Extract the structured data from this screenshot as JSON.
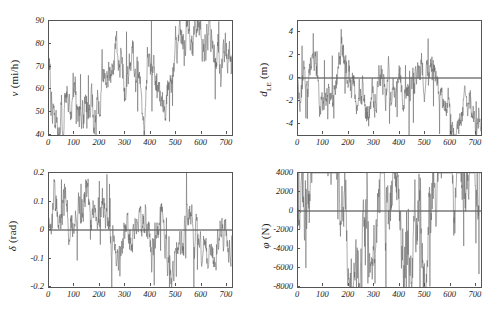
{
  "figure": {
    "background": "#ffffff",
    "line_color": "#666666",
    "axis_color": "#555555",
    "zero_line_color": "#222222"
  },
  "chart_data": [
    {
      "id": "panel-velocity",
      "type": "line",
      "title": "",
      "xlabel": "",
      "ylabel": "v (mi/h)",
      "ylabel_symbol": "v",
      "ylabel_unit": "(mi/h)",
      "ylabel_sub": "",
      "xlim": [
        0,
        720
      ],
      "ylim": [
        40,
        90
      ],
      "xticks": [
        0,
        100,
        200,
        300,
        400,
        500,
        600,
        700
      ],
      "yticks": [
        40,
        50,
        60,
        70,
        80,
        90
      ],
      "xticklabels": [
        "0",
        "100",
        "200",
        "300",
        "400",
        "500",
        "600",
        "700"
      ],
      "yticklabels": [
        "40",
        "50",
        "60",
        "70",
        "80",
        "90"
      ],
      "grid": false,
      "legend": "none",
      "zero_line": false,
      "series": [
        {
          "name": "v",
          "seed": 101,
          "mean": 69,
          "amplitude": 11,
          "clip_low": 40,
          "clip_high": 90,
          "n": 720
        }
      ]
    },
    {
      "id": "panel-lateral-offset",
      "type": "line",
      "title": "",
      "xlabel": "",
      "ylabel": "d_LE (m)",
      "ylabel_symbol": "d",
      "ylabel_unit": "(m)",
      "ylabel_sub": "LE",
      "xlim": [
        0,
        720
      ],
      "ylim": [
        -5,
        5
      ],
      "xticks": [
        0,
        100,
        200,
        300,
        400,
        500,
        600,
        700
      ],
      "yticks": [
        -4,
        -2,
        0,
        2,
        4
      ],
      "xticklabels": [
        "0",
        "100",
        "200",
        "300",
        "400",
        "500",
        "600",
        "700"
      ],
      "yticklabels": [
        "-4",
        "-2",
        "0",
        "2",
        "4"
      ],
      "grid": false,
      "legend": "none",
      "zero_line": true,
      "series": [
        {
          "name": "dLE",
          "seed": 202,
          "mean": -0.55,
          "amplitude": 1.9,
          "clip_low": -5,
          "clip_high": 5,
          "n": 720
        }
      ]
    },
    {
      "id": "panel-steering",
      "type": "line",
      "title": "",
      "xlabel": "",
      "ylabel": "δ (rad)",
      "ylabel_symbol": "δ",
      "ylabel_unit": "(rad)",
      "ylabel_sub": "",
      "xlim": [
        0,
        720
      ],
      "ylim": [
        -0.2,
        0.2
      ],
      "xticks": [
        0,
        100,
        200,
        300,
        400,
        500,
        600,
        700
      ],
      "yticks": [
        -0.2,
        -0.1,
        0,
        0.1,
        0.2
      ],
      "xticklabels": [
        "0",
        "100",
        "200",
        "300",
        "400",
        "500",
        "600",
        "700"
      ],
      "yticklabels": [
        "-0.2",
        "-0.1",
        "0",
        "0.1",
        "0.2"
      ],
      "grid": false,
      "legend": "none",
      "zero_line": true,
      "series": [
        {
          "name": "delta",
          "seed": 303,
          "mean": 0.0,
          "amplitude": 0.082,
          "clip_low": -0.2,
          "clip_high": 0.2,
          "n": 720
        }
      ]
    },
    {
      "id": "panel-force",
      "type": "line",
      "title": "",
      "xlabel": "",
      "ylabel": "φ (N)",
      "ylabel_symbol": "φ",
      "ylabel_unit": "(N)",
      "ylabel_sub": "",
      "xlim": [
        0,
        720
      ],
      "ylim": [
        -8000,
        4000
      ],
      "xticks": [
        0,
        100,
        200,
        300,
        400,
        500,
        600,
        700
      ],
      "yticks": [
        -8000,
        -6000,
        -4000,
        -2000,
        0,
        2000,
        4000
      ],
      "xticklabels": [
        "0",
        "100",
        "200",
        "300",
        "400",
        "500",
        "600",
        "700"
      ],
      "yticklabels": [
        "-8000",
        "-6000",
        "-4000",
        "-2000",
        "0",
        "2000",
        "4000"
      ],
      "grid": false,
      "legend": "none",
      "zero_line": true,
      "series": [
        {
          "name": "phi",
          "seed": 404,
          "mean": -1200,
          "amplitude": 5200,
          "clip_low": -8000,
          "clip_high": 4000,
          "n": 720
        }
      ]
    }
  ]
}
